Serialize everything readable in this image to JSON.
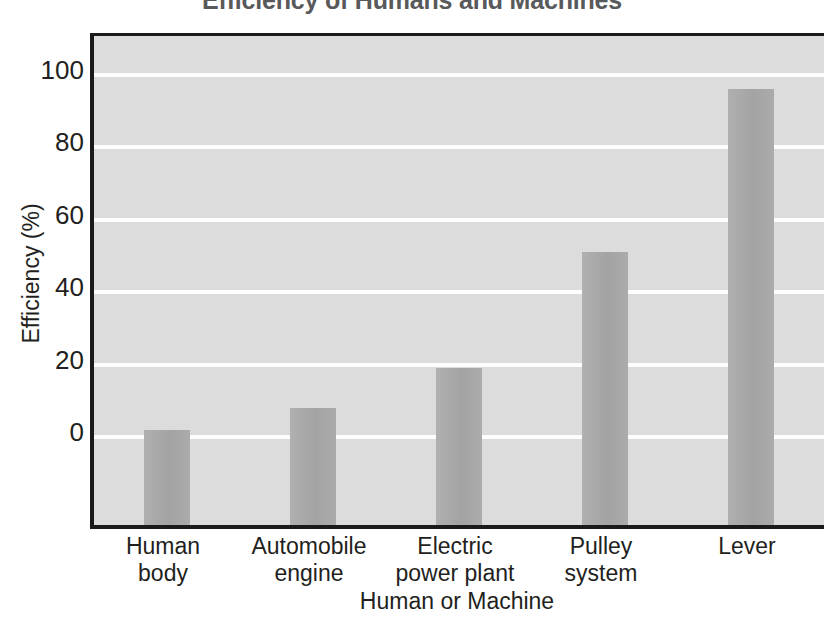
{
  "chart_data": {
    "type": "bar",
    "title": "Efficiency of Humans and Machines",
    "xlabel": "Human or Machine",
    "ylabel": "Efficiency (%)",
    "categories": [
      "Human body",
      "Automobile engine",
      "Electric power plant",
      "Pulley system",
      "Lever"
    ],
    "category_lines": [
      [
        "Human",
        "body"
      ],
      [
        "Automobile",
        "engine"
      ],
      [
        "Electric",
        "power plant"
      ],
      [
        "Pulley",
        "system"
      ],
      [
        "Lever",
        ""
      ]
    ],
    "values": [
      2,
      8,
      19,
      51,
      96
    ],
    "ylim": [
      0,
      110
    ],
    "yticks": [
      0,
      20,
      40,
      60,
      80,
      100
    ],
    "ytick_labels": [
      "0",
      "20",
      "40",
      "60",
      "80",
      "100"
    ],
    "grid": true,
    "grid_color": "#ffffff",
    "legend": "none",
    "bar_color": "#a9a9a9",
    "plot_background": "#dcdcdc",
    "title_color": "#58595b",
    "axis_color": "#1a1a1a"
  }
}
